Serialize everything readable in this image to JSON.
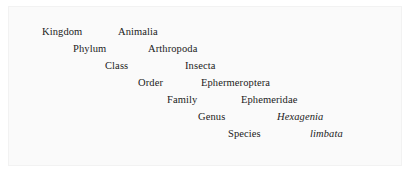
{
  "figure": {
    "background_color": "#ffffff",
    "panel_color": "#fafafa",
    "panel_border_color": "#f2f2f2",
    "text_color": "#1a1a1a"
  },
  "taxonomy": {
    "rows": [
      {
        "rank": "Kingdom",
        "taxon": "Animalia",
        "italic": false,
        "rank_x": 42,
        "taxon_x": 118,
        "y": 25
      },
      {
        "rank": "Phylum",
        "taxon": "Arthropoda",
        "italic": false,
        "rank_x": 73,
        "taxon_x": 148,
        "y": 42
      },
      {
        "rank": "Class",
        "taxon": "Insecta",
        "italic": false,
        "rank_x": 105,
        "taxon_x": 185,
        "y": 59
      },
      {
        "rank": "Order",
        "taxon": "Ephermeroptera",
        "italic": false,
        "rank_x": 138,
        "taxon_x": 201,
        "y": 76
      },
      {
        "rank": "Family",
        "taxon": "Ephemeridae",
        "italic": false,
        "rank_x": 167,
        "taxon_x": 241,
        "y": 93
      },
      {
        "rank": "Genus",
        "taxon": "Hexagenia",
        "italic": true,
        "rank_x": 198,
        "taxon_x": 277,
        "y": 110
      },
      {
        "rank": "Species",
        "taxon": "limbata",
        "italic": true,
        "rank_x": 228,
        "taxon_x": 310,
        "y": 127
      }
    ]
  }
}
